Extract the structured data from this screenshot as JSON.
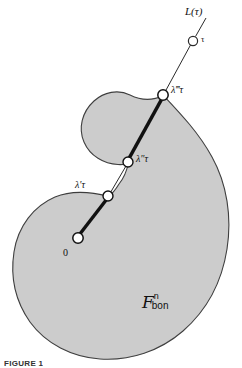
{
  "figure": {
    "caption": "FIGURE 1",
    "region": {
      "symbol": "F",
      "superscript": "n",
      "subscript": "bon",
      "fill_color": "#c9c9c9",
      "stroke_color": "#3a3a3a"
    },
    "ray": {
      "name": "L(τ)",
      "name_prefix": "L",
      "name_arg": "(τ)",
      "endpoint_label": "τ",
      "origin_label": "0"
    },
    "crossings": [
      {
        "label_base": "λ",
        "primes": "′",
        "tau": "τ",
        "text": "λ′τ"
      },
      {
        "label_base": "λ",
        "primes": "″",
        "tau": "τ",
        "text": "λ″τ"
      },
      {
        "label_base": "λ",
        "primes": "‴",
        "tau": "τ",
        "text": "λ‴τ"
      }
    ],
    "nodes": [
      {
        "name": "origin",
        "x": 78,
        "y": 238,
        "r": 5.2
      },
      {
        "name": "lambda-prime-tau",
        "x": 108,
        "y": 196,
        "r": 5.0
      },
      {
        "name": "lambda-double-prime-tau",
        "x": 128,
        "y": 162,
        "r": 5.0
      },
      {
        "name": "lambda-triple-prime-tau",
        "x": 163,
        "y": 95,
        "r": 5.2
      },
      {
        "name": "tau-endpoint",
        "x": 193,
        "y": 41,
        "r": 4.6
      }
    ]
  }
}
